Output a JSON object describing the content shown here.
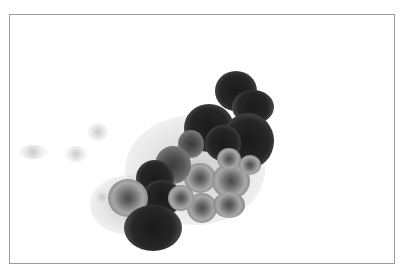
{
  "image": {
    "description": "Cytology micrograph showing a cluster of epithelial cells with dark, enlarged nuclei on a white background",
    "border_color": "#9a9a9a",
    "background_color": "#ffffff"
  }
}
